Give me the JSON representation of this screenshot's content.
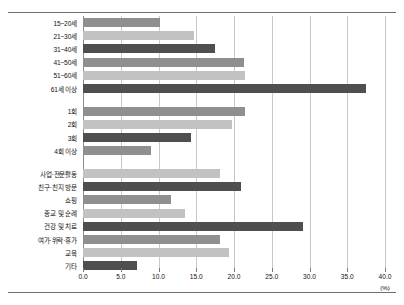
{
  "chart_data": {
    "type": "bar",
    "orientation": "horizontal",
    "title": "",
    "xlabel": "(%)",
    "ylabel": "",
    "xlim": [
      0.0,
      40.0
    ],
    "xticks": [
      "0.0",
      "5.0",
      "10.0",
      "15.0",
      "20.0",
      "25.0",
      "30.0",
      "35.0",
      "40.0"
    ],
    "grid": true,
    "legend": "none",
    "unit": "(%)",
    "groups": [
      {
        "name": "age",
        "categories": [
          "15~20세",
          "21~30세",
          "31~40세",
          "41~50세",
          "51~60세",
          "61세 이상"
        ],
        "values": [
          10.2,
          14.7,
          17.5,
          21.3,
          21.4,
          37.5
        ]
      },
      {
        "name": "frequency",
        "categories": [
          "1회",
          "2회",
          "3회",
          "4회 이상"
        ],
        "values": [
          21.4,
          19.8,
          14.3,
          9.0
        ]
      },
      {
        "name": "purpose",
        "categories": [
          "사업·전문활동",
          "친구·친지 방문",
          "쇼핑",
          "종교 및 순례",
          "건강 및 치료",
          "여가·위락·휴가",
          "교육",
          "기타"
        ],
        "values": [
          18.2,
          20.9,
          11.7,
          13.5,
          29.2,
          18.1,
          19.4,
          7.2
        ]
      }
    ],
    "colors": {
      "series_a": "#8f8f8f",
      "series_b": "#c2c2c2",
      "series_c": "#4f4f4f",
      "gridline": "#c9c9c9",
      "axis": "#8d8d8d",
      "rule": "#6f6f6f"
    }
  }
}
